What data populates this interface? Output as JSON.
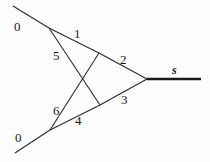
{
  "diagram": {
    "type": "network-graph",
    "nodes": {
      "left_top_end": {
        "x": 13,
        "y": 6
      },
      "left_bottom_end": {
        "x": 15,
        "y": 153
      },
      "v_top_left": {
        "x": 49,
        "y": 28
      },
      "v_top_right": {
        "x": 99,
        "y": 53
      },
      "v_bottom_left": {
        "x": 50,
        "y": 130
      },
      "v_bottom_right": {
        "x": 100,
        "y": 105
      },
      "apex": {
        "x": 147,
        "y": 79
      },
      "right_end": {
        "x": 201,
        "y": 79
      }
    },
    "edges": [
      {
        "id": "top-input",
        "from": "left_top_end",
        "to": "v_top_left",
        "label": "0"
      },
      {
        "id": "edge-1",
        "from": "v_top_left",
        "to": "v_top_right",
        "label": "1"
      },
      {
        "id": "edge-2",
        "from": "v_top_right",
        "to": "apex",
        "label": "2"
      },
      {
        "id": "edge-5",
        "from": "v_top_left",
        "to": "v_bottom_right",
        "label": "5"
      },
      {
        "id": "edge-6",
        "from": "v_bottom_left",
        "to": "v_top_right",
        "label": "6"
      },
      {
        "id": "edge-4",
        "from": "v_bottom_left",
        "to": "v_bottom_right",
        "label": "4"
      },
      {
        "id": "edge-3",
        "from": "v_bottom_right",
        "to": "apex",
        "label": "3"
      },
      {
        "id": "bottom-input",
        "from": "left_bottom_end",
        "to": "v_bottom_left",
        "label": "0"
      },
      {
        "id": "output-s",
        "from": "apex",
        "to": "right_end",
        "label": "s",
        "thick": true
      }
    ],
    "labels": {
      "top_zero": "0",
      "bottom_zero": "0",
      "one": "1",
      "two": "2",
      "three": "3",
      "four": "4",
      "five": "5",
      "six": "6",
      "s": "s"
    }
  }
}
